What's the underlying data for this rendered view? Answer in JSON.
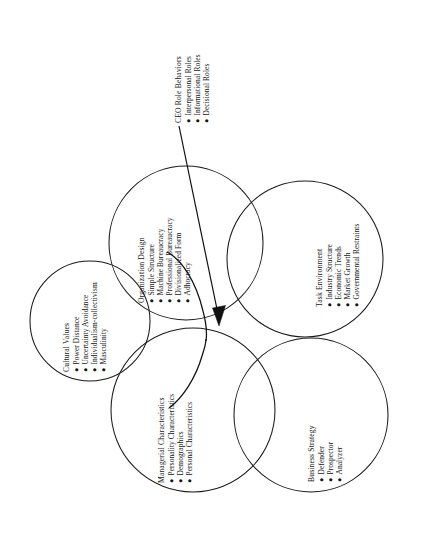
{
  "figure": {
    "background_color": "#ffffff",
    "stroke_color": "#1a1a1a",
    "text_color": "#151515",
    "bullet_glyph": "●"
  },
  "groups": [
    {
      "id": "cultural-values",
      "heading": "Cultural Values",
      "items": [
        "Power Distance",
        "Uncertainty Avoidance",
        "Individualism-collectivism",
        "Masculinity"
      ]
    },
    {
      "id": "organization-design",
      "heading": "Organization Design",
      "items": [
        "Simple Structure",
        "Machine Bureaucracy",
        "Professional Bureaucracy",
        "Divisionalized Form",
        "Adhocracy"
      ]
    },
    {
      "id": "task-environment",
      "heading": "Task Environment",
      "items": [
        "Industry Structure",
        "Economic Trends",
        "Market Growth",
        "Governmental Restraints"
      ]
    },
    {
      "id": "managerial-characteristics",
      "heading": "Managerial Characteristics",
      "items": [
        "Personality Characteristics",
        "Demographics",
        "Personal Characteristics"
      ]
    },
    {
      "id": "business-strategy",
      "heading": "Business Strategy",
      "items": [
        "Defender",
        "Prospector",
        "Analyzer"
      ]
    },
    {
      "id": "ceo-role-behaviors",
      "heading": "CEO Role Behaviors",
      "items": [
        "Interpersonal Roles",
        "Informational Roles",
        "Decisional Roles"
      ]
    }
  ]
}
